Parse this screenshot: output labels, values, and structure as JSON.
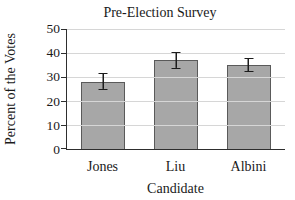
{
  "chart_data": {
    "type": "bar",
    "title": "Pre-Election Survey",
    "xlabel": "Candidate",
    "ylabel": "Percent of the Votes",
    "categories": [
      "Jones",
      "Liu",
      "Albini"
    ],
    "values": [
      28,
      37,
      35
    ],
    "errors": [
      3.5,
      3.5,
      3
    ],
    "ylim": [
      0,
      50
    ],
    "yticks": [
      0,
      10,
      20,
      30,
      40,
      50
    ],
    "grid": "horizontal",
    "legend": "none",
    "colors": {
      "bar_fill": "#a7a7a7",
      "bar_border": "#5a5a5a",
      "grid": "#d6d6d6",
      "axis": "#2e2e2e",
      "error": "#1c1c1c",
      "background": "#ffffff",
      "text": "#1a1a1a"
    }
  }
}
